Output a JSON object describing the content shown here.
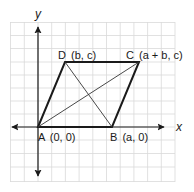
{
  "diagram": {
    "type": "coordinate-geometry-parallelogram",
    "axes": {
      "x_label": "x",
      "y_label": "y"
    },
    "vertices": [
      {
        "name": "A",
        "coords": "(0, 0)",
        "label_full": "A (0, 0)"
      },
      {
        "name": "B",
        "coords": "(a, 0)",
        "label_full": "B (a, 0)"
      },
      {
        "name": "C",
        "coords": "(a + b, c)",
        "label_full": "C (a + b, c)"
      },
      {
        "name": "D",
        "coords": "(b, c)",
        "label_full": "D (b, c)"
      }
    ],
    "sides": [
      "AB",
      "BC",
      "CD",
      "DA"
    ],
    "diagonals": [
      "AC",
      "BD"
    ],
    "colors": {
      "grid": "#d9d9d9",
      "lines": "#1a1a1a",
      "background": "#ffffff"
    }
  }
}
